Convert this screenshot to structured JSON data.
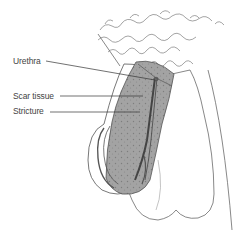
{
  "diagram": {
    "type": "anatomical-illustration",
    "labels": [
      {
        "text": "Urethra",
        "x": 13,
        "y": 58
      },
      {
        "text": "Scar tissue",
        "x": 13,
        "y": 92
      },
      {
        "text": "Stricture",
        "x": 13,
        "y": 107
      }
    ],
    "colors": {
      "line": "#555555",
      "shaded_tissue": "#9a9a9a",
      "label_text": "#444444",
      "background": "#ffffff"
    }
  }
}
